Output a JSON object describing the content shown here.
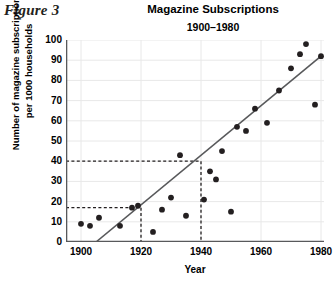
{
  "figure_label": "Figure 3",
  "chart_data": {
    "type": "scatter",
    "title": "Magazine Subscriptions",
    "subtitle": "1900–1980",
    "xlabel": "Year",
    "ylabel_line1": "Number of magazine subscriptions",
    "ylabel_line2": "per 1000 households",
    "xlim": [
      1895,
      1981
    ],
    "ylim": [
      0,
      100
    ],
    "xticks": [
      1900,
      1920,
      1940,
      1960,
      1980
    ],
    "yticks": [
      0,
      10,
      20,
      30,
      40,
      50,
      60,
      70,
      80,
      90,
      100
    ],
    "grid": true,
    "legend": "none",
    "point_color": "#231f20",
    "line_color": "#58595b",
    "grid_color": "#e8e8e8",
    "axis_color": "#58595b",
    "points": [
      {
        "x": 1900,
        "y": 9
      },
      {
        "x": 1903,
        "y": 8
      },
      {
        "x": 1906,
        "y": 12
      },
      {
        "x": 1913,
        "y": 8
      },
      {
        "x": 1924,
        "y": 5
      },
      {
        "x": 1917,
        "y": 17
      },
      {
        "x": 1919,
        "y": 18
      },
      {
        "x": 1927,
        "y": 16
      },
      {
        "x": 1930,
        "y": 22
      },
      {
        "x": 1933,
        "y": 43
      },
      {
        "x": 1935,
        "y": 13
      },
      {
        "x": 1941,
        "y": 21
      },
      {
        "x": 1943,
        "y": 35
      },
      {
        "x": 1945,
        "y": 31
      },
      {
        "x": 1947,
        "y": 45
      },
      {
        "x": 1950,
        "y": 15
      },
      {
        "x": 1952,
        "y": 57
      },
      {
        "x": 1955,
        "y": 55
      },
      {
        "x": 1958,
        "y": 66
      },
      {
        "x": 1962,
        "y": 59
      },
      {
        "x": 1966,
        "y": 75
      },
      {
        "x": 1970,
        "y": 86
      },
      {
        "x": 1973,
        "y": 93
      },
      {
        "x": 1975,
        "y": 98
      },
      {
        "x": 1978,
        "y": 68
      },
      {
        "x": 1980,
        "y": 92
      }
    ],
    "trend_line": {
      "x1": 1905,
      "y1": 0,
      "x2": 1980,
      "y2": 92
    },
    "reference_lines": [
      {
        "y": 17,
        "x": 1920,
        "style": "dashed"
      },
      {
        "y": 40,
        "x": 1940,
        "style": "dashed"
      }
    ]
  }
}
